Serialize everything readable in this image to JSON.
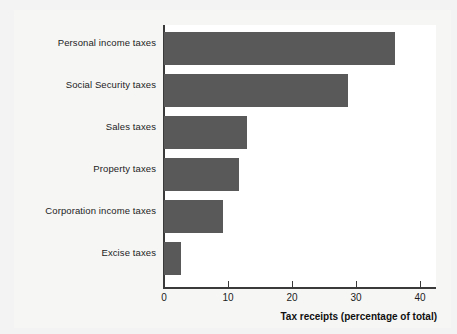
{
  "chart_data": {
    "type": "bar",
    "orientation": "horizontal",
    "title": "",
    "xlabel": "Tax receipts (percentage of total)",
    "ylabel": "",
    "categories": [
      "Personal income taxes",
      "Social Security taxes",
      "Sales taxes",
      "Property taxes",
      "Corporation income taxes",
      "Excise taxes"
    ],
    "values": [
      36.1,
      28.8,
      13.0,
      11.7,
      9.2,
      2.7
    ],
    "xlim": [
      0,
      42.5
    ],
    "xticks": [
      0,
      10,
      20,
      30,
      40
    ],
    "xtick_labels": [
      "0",
      "10",
      "20",
      "30",
      "40"
    ],
    "grid": false,
    "legend": null,
    "colors": {
      "bar_fill": "#595959",
      "axis": "#3a3a3a",
      "plot_background": "#ffffff",
      "figure_background": "#f3f3f3",
      "text": "#1c1c1c"
    }
  }
}
